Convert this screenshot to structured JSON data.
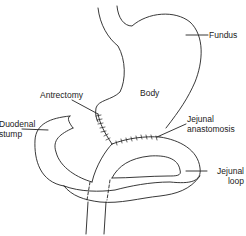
{
  "diagram": {
    "labels": {
      "fundus": "Fundus",
      "body": "Body",
      "antrectomy": "Antrectomy",
      "duodenal_stump_line1": "Duodenal",
      "duodenal_stump_line2": "stump",
      "jejunal_anastomosis_line1": "Jejunal",
      "jejunal_anastomosis_line2": "anastomosis",
      "jejunal_loop_line1": "Jejunal",
      "jejunal_loop_line2": "loop"
    },
    "colors": {
      "line": "#222222",
      "background": "#ffffff"
    }
  }
}
